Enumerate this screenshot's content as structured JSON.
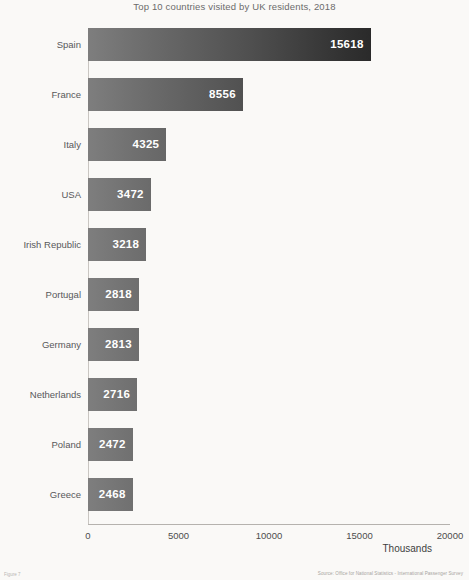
{
  "chart_data": {
    "type": "bar",
    "orientation": "horizontal",
    "title": "Top 10 countries visited by UK residents, 2018",
    "xlabel": "Thousands",
    "ylabel": "",
    "xlim": [
      0,
      20000
    ],
    "xticks": [
      0,
      5000,
      10000,
      15000,
      20000
    ],
    "xtick_labels": [
      "0",
      "5000",
      "10000",
      "15000",
      "20000"
    ],
    "grid": false,
    "legend": false,
    "categories": [
      "Spain",
      "France",
      "Italy",
      "USA",
      "Irish Republic",
      "Portugal",
      "Germany",
      "Netherlands",
      "Poland",
      "Greece"
    ],
    "values": [
      15618,
      8556,
      4325,
      3472,
      3218,
      2818,
      2813,
      2716,
      2472,
      2468
    ],
    "value_labels": [
      "15618",
      "8556",
      "4325",
      "3472",
      "3218",
      "2818",
      "2813",
      "2716",
      "2472",
      "2468"
    ],
    "bar_gradient_start": "#7e7e7e",
    "bar_gradient_end": "#161616",
    "value_label_color": "#ffffff",
    "title_color": "#6b6b6b",
    "axis_color": "#b5b2ae"
  },
  "footer": {
    "figure_caption": "Figure 7",
    "source": "Source: Office for National Statistics - International Passenger Survey"
  }
}
